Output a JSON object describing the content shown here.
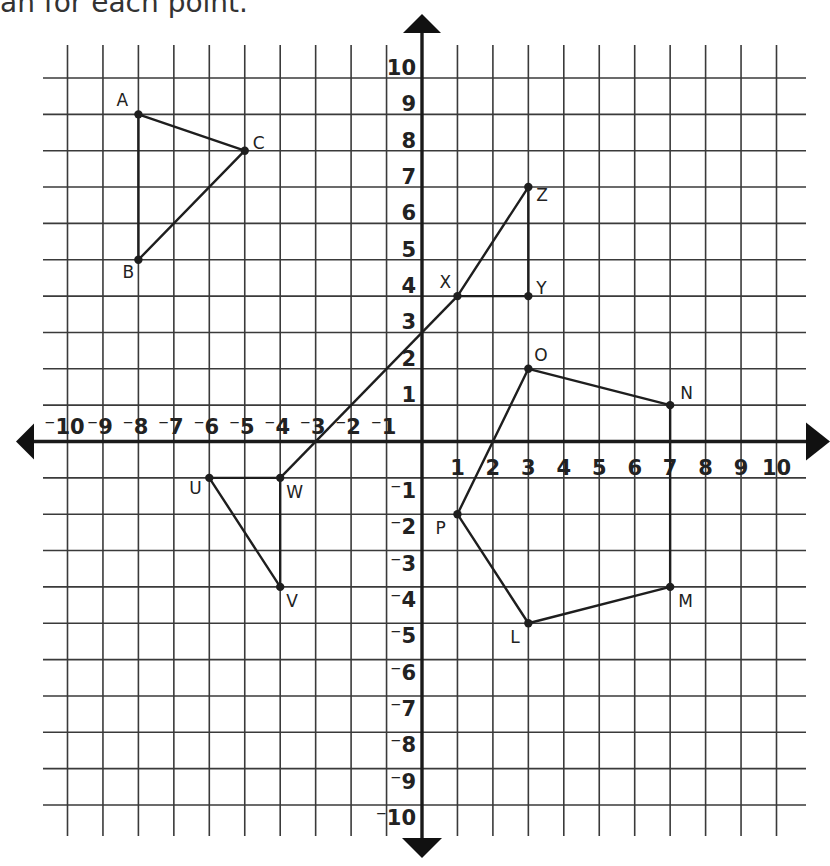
{
  "caption": "an for each point.",
  "chart_data": {
    "type": "scatter",
    "title": "",
    "xlabel": "",
    "ylabel": "",
    "xlim": [
      -10,
      10
    ],
    "ylim": [
      -10,
      10
    ],
    "grid": true,
    "x_ticks": [
      "-10",
      "-9",
      "-8",
      "-7",
      "-6",
      "-5",
      "-4",
      "-3",
      "-2",
      "-1",
      "1",
      "2",
      "3",
      "4",
      "5",
      "6",
      "7",
      "8",
      "9",
      "10"
    ],
    "y_ticks": [
      "10",
      "9",
      "8",
      "7",
      "6",
      "5",
      "4",
      "3",
      "2",
      "1",
      "-1",
      "-2",
      "-3",
      "-4",
      "-5",
      "-6",
      "-7",
      "-8",
      "-9",
      "-10"
    ],
    "points": [
      {
        "label": "A",
        "x": -8,
        "y": 9
      },
      {
        "label": "B",
        "x": -8,
        "y": 5
      },
      {
        "label": "C",
        "x": -5,
        "y": 8
      },
      {
        "label": "X",
        "x": 1,
        "y": 4
      },
      {
        "label": "Y",
        "x": 3,
        "y": 4
      },
      {
        "label": "Z",
        "x": 3,
        "y": 7
      },
      {
        "label": "U",
        "x": -6,
        "y": -1
      },
      {
        "label": "V",
        "x": -4,
        "y": -4
      },
      {
        "label": "W",
        "x": -4,
        "y": -1
      },
      {
        "label": "O",
        "x": 3,
        "y": 2
      },
      {
        "label": "N",
        "x": 7,
        "y": 1
      },
      {
        "label": "M",
        "x": 7,
        "y": -4
      },
      {
        "label": "L",
        "x": 3,
        "y": -5
      },
      {
        "label": "P",
        "x": 1,
        "y": -2
      }
    ],
    "shapes": [
      {
        "name": "triangle ABC",
        "vertices": [
          "A",
          "C",
          "B"
        ],
        "closed": true
      },
      {
        "name": "triangle XYZ",
        "vertices": [
          "X",
          "Y",
          "Z"
        ],
        "closed": true
      },
      {
        "name": "triangle UVW",
        "vertices": [
          "U",
          "W",
          "V"
        ],
        "closed": true
      },
      {
        "name": "pentagon LMNOP",
        "vertices": [
          "O",
          "N",
          "M",
          "L",
          "P"
        ],
        "closed": true
      },
      {
        "name": "line through W and X",
        "vertices": [
          "W",
          "X"
        ],
        "closed": false
      }
    ]
  },
  "label_offsets": {
    "A": [
      -22,
      -8
    ],
    "B": [
      -16,
      18
    ],
    "C": [
      8,
      -2
    ],
    "X": [
      -18,
      -8
    ],
    "Y": [
      8,
      -2
    ],
    "Z": [
      8,
      14
    ],
    "U": [
      -20,
      16
    ],
    "V": [
      6,
      20
    ],
    "W": [
      6,
      20
    ],
    "O": [
      6,
      -8
    ],
    "N": [
      10,
      -6
    ],
    "M": [
      8,
      20
    ],
    "L": [
      -18,
      20
    ],
    "P": [
      -22,
      20
    ]
  }
}
